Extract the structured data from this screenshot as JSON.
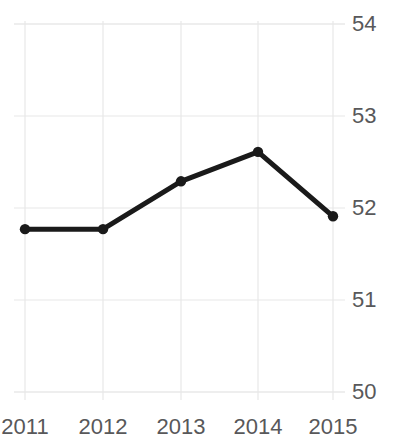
{
  "chart_data": {
    "type": "line",
    "title": "Western Trend",
    "xlabel": "",
    "ylabel": "",
    "categories": [
      "2011",
      "2012",
      "2013",
      "2014",
      "2015"
    ],
    "values": [
      51.77,
      51.77,
      52.29,
      52.61,
      51.91
    ],
    "series": [
      {
        "name": "Western Trend",
        "values": [
          51.77,
          51.77,
          52.29,
          52.61,
          51.91
        ]
      }
    ],
    "ylim": [
      50,
      54
    ],
    "y_ticks": [
      "50",
      "51",
      "52",
      "53",
      "54"
    ],
    "y_tick_values": [
      50,
      51,
      52,
      53,
      54
    ],
    "x_ticks": [
      "2011",
      "2012",
      "2013",
      "2014",
      "2015"
    ],
    "grid": true,
    "legend": "none",
    "y_axis_position": "right",
    "line_color": "#1a1a1a",
    "grid_color": "#e8e8e8",
    "tick_label_color": "#58585a",
    "background_color": "#ffffff",
    "marker": "circle",
    "line_width": 5
  }
}
